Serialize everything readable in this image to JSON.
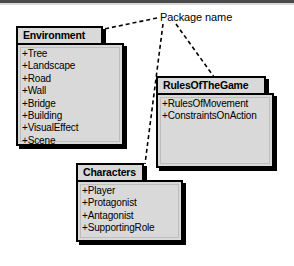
{
  "diagram": {
    "type": "uml-package-diagram",
    "annotation": {
      "label": "Package name",
      "leader_targets": [
        "Environment",
        "Characters",
        "RulesOfTheGame"
      ]
    },
    "packages": [
      {
        "id": "environment",
        "name": "Environment",
        "members": [
          "+Tree",
          "+Landscape",
          "+Road",
          "+Wall",
          "+Bridge",
          "+Building",
          "+VisualEffect",
          "+Scene"
        ]
      },
      {
        "id": "rules-of-the-game",
        "name": "RulesOfTheGame",
        "members": [
          "+RulesOfMovement",
          "+ConstraintsOnAction"
        ]
      },
      {
        "id": "characters",
        "name": "Characters",
        "members": [
          "+Player",
          "+Protagonist",
          "+Antagonist",
          "+SupportingRole"
        ]
      }
    ]
  },
  "colors": {
    "package_fill": "#d9d9d9",
    "stroke": "#000000",
    "shadow": "#000000",
    "page_background": "#ffffff",
    "top_rule": "#4a4a4a"
  }
}
